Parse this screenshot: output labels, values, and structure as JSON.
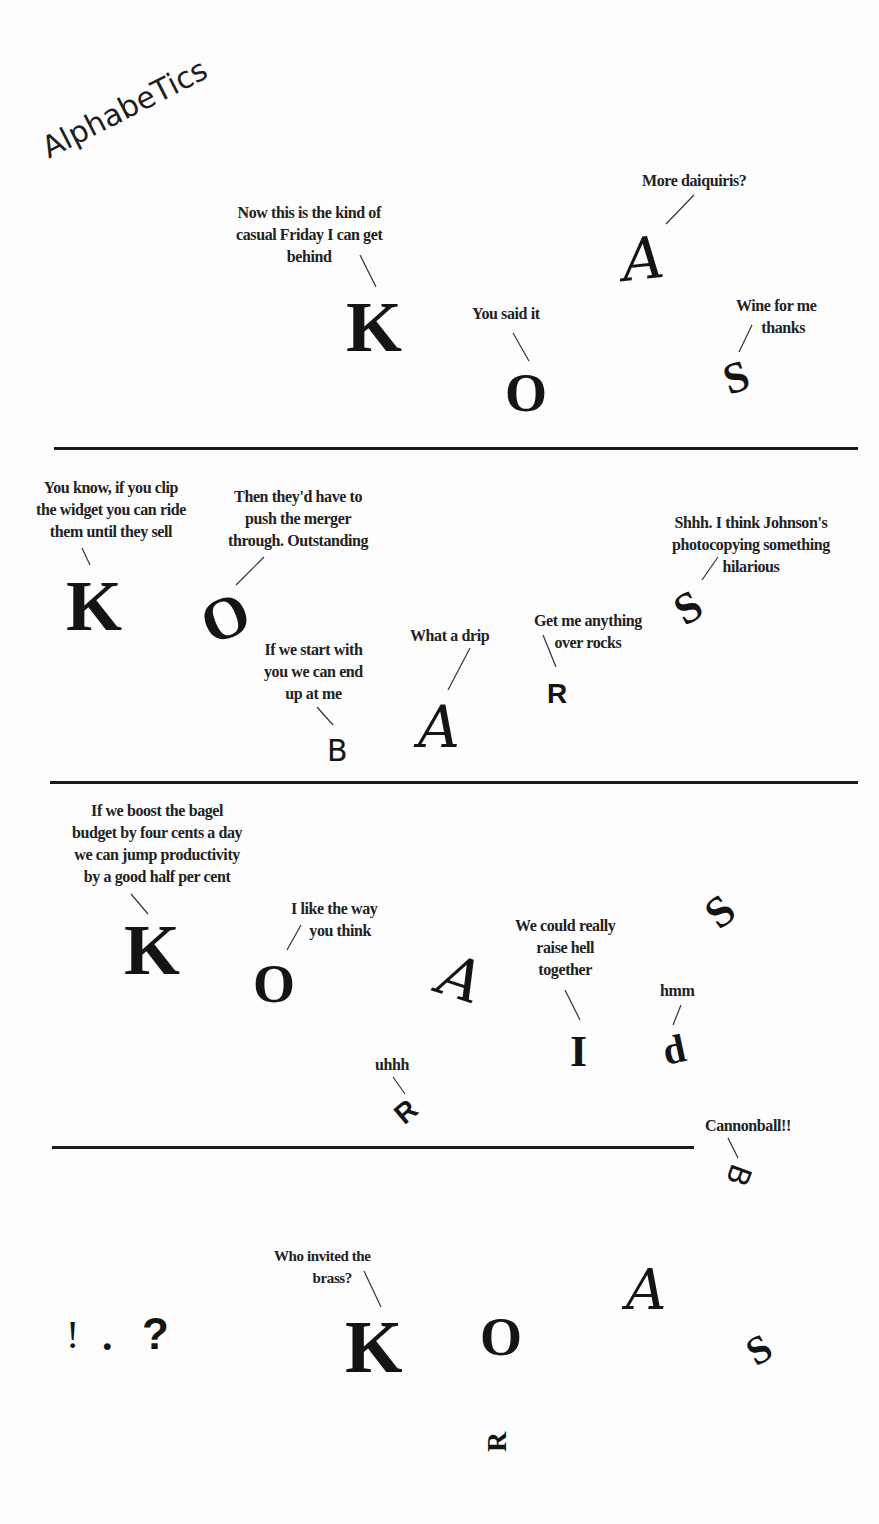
{
  "title": "AlphabeTics",
  "panels": [
    {
      "characters": [
        {
          "glyph": "K",
          "style": "serif"
        },
        {
          "glyph": "O",
          "style": "serif"
        },
        {
          "glyph": "A",
          "style": "script"
        },
        {
          "glyph": "S",
          "style": "serif",
          "rotation": "tilted"
        }
      ],
      "captions": [
        {
          "speaker": "K",
          "text_lines": [
            "Now this is the kind of",
            "casual Friday I can get",
            "behind"
          ]
        },
        {
          "speaker": "O",
          "text_lines": [
            "You said it"
          ]
        },
        {
          "speaker": "A",
          "text_lines": [
            "More daiquiris?"
          ]
        },
        {
          "speaker": "S",
          "text_lines": [
            "Wine for me",
            "thanks"
          ]
        }
      ]
    },
    {
      "characters": [
        {
          "glyph": "K",
          "style": "serif"
        },
        {
          "glyph": "O",
          "style": "serif",
          "rotation": "tilted"
        },
        {
          "glyph": "B",
          "style": "hand"
        },
        {
          "glyph": "A",
          "style": "script"
        },
        {
          "glyph": "R",
          "style": "sans"
        },
        {
          "glyph": "S",
          "style": "serif",
          "rotation": "tilted"
        }
      ],
      "captions": [
        {
          "speaker": "K",
          "text_lines": [
            "You know, if you clip",
            "the widget you can ride",
            "them until they sell"
          ]
        },
        {
          "speaker": "O",
          "text_lines": [
            "Then they'd have to",
            "push the merger",
            "through. Outstanding"
          ]
        },
        {
          "speaker": "B",
          "text_lines": [
            "If we start with",
            "you we can end",
            "up at me"
          ]
        },
        {
          "speaker": "A",
          "text_lines": [
            "What a drip"
          ]
        },
        {
          "speaker": "R",
          "text_lines": [
            "Get me anything",
            "over rocks"
          ]
        },
        {
          "speaker": "S",
          "text_lines": [
            "Shhh. I think Johnson's",
            "photocopying something",
            "hilarious"
          ]
        }
      ]
    },
    {
      "characters": [
        {
          "glyph": "K",
          "style": "serif"
        },
        {
          "glyph": "O",
          "style": "serif"
        },
        {
          "glyph": "A",
          "style": "script",
          "rotation": "tilted"
        },
        {
          "glyph": "I",
          "style": "serif"
        },
        {
          "glyph": "d",
          "style": "serif",
          "rotation": "tilted"
        },
        {
          "glyph": "S",
          "style": "serif",
          "rotation": "tilted"
        },
        {
          "glyph": "R",
          "style": "sans",
          "rotation": "tilted"
        },
        {
          "glyph": "B",
          "style": "hand",
          "rotation": "diving"
        }
      ],
      "captions": [
        {
          "speaker": "K",
          "text_lines": [
            "If we boost the bagel",
            "budget by four cents a day",
            "we can jump productivity",
            "by a good half per cent"
          ]
        },
        {
          "speaker": "O",
          "text_lines": [
            "I like the way",
            "you think"
          ]
        },
        {
          "speaker": "I",
          "text_lines": [
            "We could really",
            "raise hell",
            "together"
          ]
        },
        {
          "speaker": "d",
          "text_lines": [
            "hmm"
          ]
        },
        {
          "speaker": "R",
          "text_lines": [
            "uhhh"
          ]
        },
        {
          "speaker": "B",
          "text_lines": [
            "Cannonball!!"
          ]
        }
      ]
    },
    {
      "characters": [
        {
          "glyph": "!",
          "style": "serif"
        },
        {
          "glyph": ".",
          "style": "serif"
        },
        {
          "glyph": "?",
          "style": "sans"
        },
        {
          "glyph": "K",
          "style": "serif"
        },
        {
          "glyph": "O",
          "style": "serif"
        },
        {
          "glyph": "A",
          "style": "script"
        },
        {
          "glyph": "S",
          "style": "serif",
          "rotation": "tilted"
        },
        {
          "glyph": "R",
          "style": "serif",
          "rotation": "sideways"
        }
      ],
      "captions": [
        {
          "speaker": "K",
          "text_lines": [
            "Who invited the",
            "brass?"
          ]
        }
      ]
    }
  ],
  "colors": {
    "background": "#fdfdfd",
    "ink": "#141414",
    "divider": "#1c1c1c"
  }
}
